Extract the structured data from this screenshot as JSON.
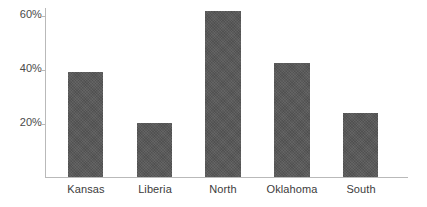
{
  "chart_data": {
    "type": "bar",
    "title": "",
    "subtitle": "",
    "xlabel": "",
    "ylabel": "",
    "categories": [
      "Kansas",
      "Liberia",
      "North",
      "Oklahoma",
      "South"
    ],
    "values": [
      39,
      20,
      62,
      42.5,
      24
    ],
    "value_labels": [
      "39%",
      "20%",
      "62%",
      "42.5%",
      "24%"
    ],
    "ylim": [
      0,
      66
    ],
    "yticks": [
      20,
      40,
      60
    ],
    "ytick_labels": [
      "20%",
      "40%",
      "60%"
    ],
    "grid": false,
    "legend": null,
    "legend_position": "none",
    "series": [
      {
        "name": "",
        "values": [
          39,
          20,
          62,
          42.5,
          24
        ]
      }
    ],
    "bar_color": "#575757",
    "axis_color": "#b9b9b9",
    "text_color": "#3c3c3c",
    "background_color": "#ffffff"
  }
}
